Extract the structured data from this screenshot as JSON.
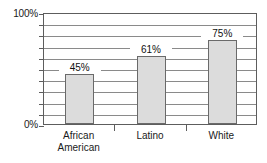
{
  "chart_data": {
    "type": "bar",
    "title": "",
    "subtitle": "",
    "xlabel": "",
    "ylabel": "",
    "categories": [
      "African\nAmerican",
      "Latino",
      "White"
    ],
    "values": [
      45,
      61,
      75
    ],
    "data_labels": [
      "45%",
      "61%",
      "75%"
    ],
    "ylim": [
      0,
      100
    ],
    "ytick_labels": [
      "0%",
      "100%"
    ],
    "ytick_values": [
      0,
      100
    ],
    "gridlines": [
      0,
      10,
      20,
      30,
      40,
      50,
      60,
      70,
      80,
      90,
      100
    ],
    "grid": true,
    "legend": "none",
    "series": [
      {
        "name": "",
        "values": [
          45,
          61,
          75
        ]
      }
    ]
  },
  "axis": {
    "y_top_label": "100%",
    "y_bottom_label": "0%"
  },
  "bars": [
    {
      "label": "African\nAmerican",
      "value_label": "45%",
      "value": 45
    },
    {
      "label": "Latino",
      "value_label": "61%",
      "value": 61
    },
    {
      "label": "White",
      "value_label": "75%",
      "value": 75
    }
  ],
  "colors": {
    "bar_fill": "#dcdcdc",
    "bar_border": "#6a6a6a",
    "grid": "#8a8a8a",
    "frame": "#5d5d5d",
    "text": "#1a1a1a",
    "background": "#ffffff"
  }
}
